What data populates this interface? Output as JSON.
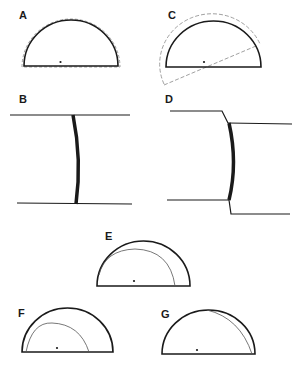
{
  "figure": {
    "panels": [
      {
        "id": "A",
        "label": "A",
        "description": "Semicircle with dashed outer outline"
      },
      {
        "id": "B",
        "label": "B",
        "description": "Two horizontal parallel lines joined by a thick curved bar"
      },
      {
        "id": "C",
        "label": "C",
        "description": "Semicircle with dashed rotated arc and dashed diameter line"
      },
      {
        "id": "D",
        "label": "D",
        "description": "Offset parallel lines joined by a thick curved bar"
      },
      {
        "id": "E",
        "label": "E",
        "description": "Semicircle with inner thin arc shifted left"
      },
      {
        "id": "F",
        "label": "F",
        "description": "Semicircle with smaller inner thin arc"
      },
      {
        "id": "G",
        "label": "G",
        "description": "Semicircle with inner thin arc along right side"
      }
    ],
    "colors": {
      "stroke": "#1a1a1a",
      "thin": "#555555",
      "dashed": "#777777",
      "background": "#ffffff"
    }
  }
}
